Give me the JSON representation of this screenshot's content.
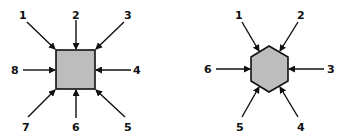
{
  "diagram": {
    "colors": {
      "fill": "#bdbdbd",
      "stroke": "#111111",
      "background": "#ffffff"
    },
    "square": {
      "label": "square-with-8-arrows",
      "arrows": [
        {
          "label": "1",
          "direction": "top-left"
        },
        {
          "label": "2",
          "direction": "top"
        },
        {
          "label": "3",
          "direction": "top-right"
        },
        {
          "label": "4",
          "direction": "right"
        },
        {
          "label": "5",
          "direction": "bottom-right"
        },
        {
          "label": "6",
          "direction": "bottom"
        },
        {
          "label": "7",
          "direction": "bottom-left"
        },
        {
          "label": "8",
          "direction": "left"
        }
      ]
    },
    "hexagon": {
      "label": "hexagon-with-6-arrows",
      "arrows": [
        {
          "label": "1",
          "direction": "upper-left"
        },
        {
          "label": "2",
          "direction": "upper-right"
        },
        {
          "label": "3",
          "direction": "right"
        },
        {
          "label": "4",
          "direction": "lower-right"
        },
        {
          "label": "5",
          "direction": "lower-left"
        },
        {
          "label": "6",
          "direction": "left"
        }
      ]
    }
  }
}
